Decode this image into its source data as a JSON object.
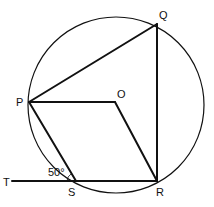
{
  "diagram": {
    "type": "circle-geometry",
    "circle": {
      "center": [
        116,
        105
      ],
      "radius": 88
    },
    "points": {
      "P": {
        "label": "P",
        "x": 29,
        "y": 102,
        "label_x": 16,
        "label_y": 106
      },
      "Q": {
        "label": "Q",
        "x": 157,
        "y": 24,
        "label_x": 159,
        "label_y": 19
      },
      "O": {
        "label": "O",
        "x": 115,
        "y": 102,
        "label_x": 117,
        "label_y": 98
      },
      "R": {
        "label": "R",
        "x": 157,
        "y": 181,
        "label_x": 156,
        "label_y": 196
      },
      "S": {
        "label": "S",
        "x": 76,
        "y": 181,
        "label_x": 68,
        "label_y": 196
      },
      "T": {
        "label": "T",
        "x": 12,
        "y": 181,
        "label_x": 3,
        "label_y": 186
      }
    },
    "segments": [
      [
        "P",
        "Q"
      ],
      [
        "Q",
        "R"
      ],
      [
        "P",
        "O"
      ],
      [
        "O",
        "R"
      ],
      [
        "P",
        "S"
      ],
      [
        "T",
        "R"
      ]
    ],
    "angle_label": {
      "text": "50°",
      "x": 48,
      "y": 176
    },
    "stroke_color": "#111111"
  }
}
